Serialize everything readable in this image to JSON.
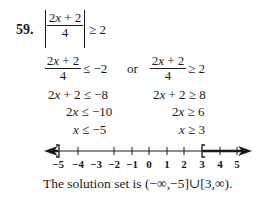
{
  "problem": {
    "number": "59.",
    "original": {
      "numerator_lhs": "2",
      "numerator_var": "x",
      "numerator_rhs": " + 2",
      "denominator": "4",
      "relation": "≥ 2"
    },
    "case_left": {
      "fraction": {
        "numerator_lhs": "2",
        "numerator_var": "x",
        "numerator_rhs": " + 2",
        "denominator": "4"
      },
      "relation": "≤ −2",
      "steps": [
        {
          "var_prefix": "2",
          "var": "x",
          "rest": " + 2 ≤ −8"
        },
        {
          "var_prefix": "2",
          "var": "x",
          "rest": " ≤ −10"
        },
        {
          "var_prefix": "",
          "var": "x",
          "rest": " ≤ −5"
        }
      ]
    },
    "connector": "or",
    "case_right": {
      "fraction": {
        "numerator_lhs": "2",
        "numerator_var": "x",
        "numerator_rhs": " + 2",
        "denominator": "4"
      },
      "relation": "≥ 2",
      "steps": [
        {
          "var_prefix": "2",
          "var": "x",
          "rest": " + 2 ≥ 8"
        },
        {
          "var_prefix": "2",
          "var": "x",
          "rest": " ≥ 6"
        },
        {
          "var_prefix": "",
          "var": "x",
          "rest": " ≥ 3"
        }
      ]
    },
    "number_line": {
      "tick_labels": [
        "−5",
        "−4",
        "−3",
        "−2",
        "−1",
        "0",
        "1",
        "2",
        "3",
        "4",
        "5"
      ],
      "left_bracket": "]",
      "right_bracket": "[",
      "left_endpoint": -5,
      "right_endpoint": 3
    },
    "conclusion": {
      "prefix": "The solution set is ",
      "interval": "(−∞,−5]∪[3,∞)."
    }
  }
}
